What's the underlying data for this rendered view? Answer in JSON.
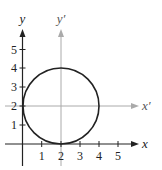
{
  "diagram": {
    "type": "coordinate-plane-with-translated-axes",
    "original_axes": {
      "x_label": "x",
      "y_label": "y",
      "color": "#222222"
    },
    "translated_axes": {
      "x_label": "x′",
      "y_label": "y′",
      "origin": [
        2,
        2
      ],
      "color": "#aaaaaa"
    },
    "x_ticks": [
      "1",
      "2",
      "3",
      "4",
      "5"
    ],
    "y_ticks": [
      "1",
      "2",
      "3",
      "4",
      "5"
    ],
    "circle": {
      "center": [
        2,
        2
      ],
      "radius": 2,
      "color": "#222222"
    },
    "grid_color": "#bbbbbb"
  }
}
